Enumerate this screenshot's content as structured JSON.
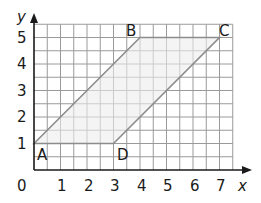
{
  "chart_data": {
    "type": "diagram",
    "title": "",
    "xlabel": "x",
    "ylabel": "y",
    "xlim": [
      0,
      7.5
    ],
    "ylim": [
      0,
      5.5
    ],
    "grid": true,
    "grid_step": 0.5,
    "x_ticks": [
      "0",
      "1",
      "2",
      "3",
      "4",
      "5",
      "6",
      "7"
    ],
    "y_ticks": [
      "1",
      "2",
      "3",
      "4",
      "5"
    ],
    "shape": "parallelogram",
    "vertices": [
      {
        "label": "A",
        "x": 0,
        "y": 1
      },
      {
        "label": "B",
        "x": 4,
        "y": 5
      },
      {
        "label": "C",
        "x": 7,
        "y": 5
      },
      {
        "label": "D",
        "x": 3,
        "y": 1
      }
    ]
  },
  "colors": {
    "grid": "#9a9a9a",
    "axis": "#1a1a1a",
    "shape_stroke": "#8c8c8c",
    "shape_fill": "#ececec"
  },
  "labels": {
    "origin": "0",
    "x_axis": "x",
    "y_axis": "y",
    "x1": "1",
    "x2": "2",
    "x3": "3",
    "x4": "4",
    "x5": "5",
    "x6": "6",
    "x7": "7",
    "y1": "1",
    "y2": "2",
    "y3": "3",
    "y4": "4",
    "y5": "5",
    "A": "A",
    "B": "B",
    "C": "C",
    "D": "D"
  }
}
